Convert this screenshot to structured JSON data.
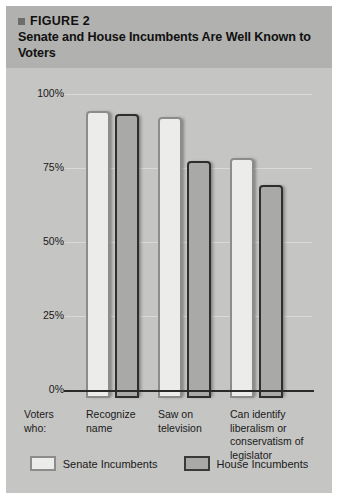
{
  "figure": {
    "bullet_icon": "square-bullet-icon",
    "kicker": "FIGURE 2",
    "title": "Senate and House Incumbents Are Well Known to Voters"
  },
  "axis": {
    "row_label": "Voters who:",
    "y_ticks": [
      "100%",
      "75%",
      "50%",
      "25%",
      "0%"
    ]
  },
  "legend": {
    "entries": [
      {
        "label": "Senate Incumbents",
        "color": "#ececeb"
      },
      {
        "label": "House Incumbents",
        "color": "#a9a9a7"
      }
    ]
  },
  "chart_data": {
    "type": "bar",
    "title": "Senate and House Incumbents Are Well Known to Voters",
    "xlabel": "Voters who:",
    "ylabel": "",
    "ylim": [
      0,
      100
    ],
    "yticks": [
      0,
      25,
      50,
      75,
      100
    ],
    "ytick_labels": [
      "0%",
      "25%",
      "50%",
      "75%",
      "100%"
    ],
    "grid": true,
    "legend_position": "bottom",
    "categories": [
      "Recognize name",
      "Saw on television",
      "Can identify liberalism or conservatism of legislator"
    ],
    "series": [
      {
        "name": "Senate Incumbents",
        "color": "#ececeb",
        "values": [
          97,
          95,
          81
        ]
      },
      {
        "name": "House Incumbents",
        "color": "#a9a9a7",
        "values": [
          96,
          80,
          72
        ]
      }
    ]
  }
}
